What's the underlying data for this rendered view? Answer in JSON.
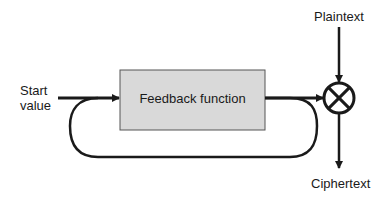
{
  "diagram": {
    "title": "",
    "nodes": {
      "start": {
        "label_line1": "Start",
        "label_line2": "value"
      },
      "feedback": {
        "label": "Feedback function",
        "fill": "#d9d9d9",
        "stroke": "#555555"
      },
      "xor": {
        "symbol": "XOR (circled cross)"
      },
      "plaintext": {
        "label": "Plaintext"
      },
      "ciphertext": {
        "label": "Ciphertext"
      }
    },
    "edges": [
      {
        "from": "start",
        "to": "feedback"
      },
      {
        "from": "feedback",
        "to": "xor"
      },
      {
        "from": "feedback",
        "to": "feedback",
        "type": "loop"
      },
      {
        "from": "plaintext",
        "to": "xor"
      },
      {
        "from": "xor",
        "to": "ciphertext"
      }
    ],
    "colors": {
      "line": "#1a1a1a",
      "box_fill": "#d9d9d9",
      "background": "#ffffff"
    }
  }
}
